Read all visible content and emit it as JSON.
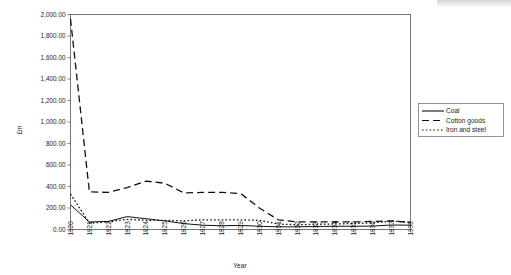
{
  "chart_data": {
    "type": "line",
    "title": "",
    "xlabel": "Year",
    "ylabel": "£m",
    "xlim": [
      1920,
      1938
    ],
    "ylim": [
      0,
      2000
    ],
    "ytick_step": 200,
    "grid": false,
    "legend_position": "right",
    "x": [
      1920,
      1921,
      1922,
      1923,
      1924,
      1925,
      1926,
      1927,
      1928,
      1929,
      1930,
      1931,
      1932,
      1933,
      1934,
      1935,
      1936,
      1937,
      1938
    ],
    "ytick_labels": [
      "0.00",
      "200.00",
      "400.00",
      "600.00",
      "800.00",
      "1,000.00",
      "1,200.00",
      "1,400.00",
      "1,600.00",
      "1,800.00",
      "2,000.00"
    ],
    "ytick_values": [
      0,
      200,
      400,
      600,
      800,
      1000,
      1200,
      1400,
      1600,
      1800,
      2000
    ],
    "xtick_labels": [
      "1920",
      "1921",
      "1922",
      "1923",
      "1924",
      "1925",
      "1926",
      "1927",
      "1928",
      "1929",
      "1930",
      "1931",
      "1932",
      "1933",
      "1934",
      "1935",
      "1936",
      "1937",
      "1938"
    ],
    "series": [
      {
        "name": "Coal",
        "style": "solid",
        "color": "#111111",
        "values": [
          230,
          70,
          75,
          120,
          100,
          80,
          55,
          40,
          35,
          38,
          30,
          25,
          25,
          28,
          30,
          30,
          32,
          42,
          40
        ]
      },
      {
        "name": "Cotton goods",
        "style": "dashed",
        "color": "#111111",
        "values": [
          1960,
          350,
          345,
          390,
          450,
          430,
          340,
          345,
          345,
          335,
          200,
          90,
          70,
          70,
          72,
          70,
          75,
          80,
          65
        ]
      },
      {
        "name": "Iron and steel",
        "style": "dotted",
        "color": "#111111",
        "values": [
          330,
          60,
          70,
          95,
          85,
          85,
          80,
          90,
          90,
          90,
          85,
          50,
          45,
          48,
          52,
          55,
          62,
          78,
          68
        ]
      }
    ]
  },
  "legend": {
    "items": [
      {
        "label": "Coal",
        "style": "solid"
      },
      {
        "label": "Cotton goods",
        "style": "dashed"
      },
      {
        "label": "Iron and steel",
        "style": "dotted"
      }
    ]
  },
  "axes": {
    "y_title": "£m",
    "x_title": "Year"
  }
}
